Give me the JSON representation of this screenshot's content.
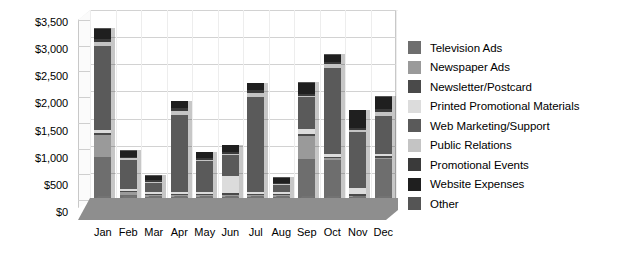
{
  "chart_data": {
    "type": "bar",
    "stacked": true,
    "title": "",
    "xlabel": "",
    "ylabel": "",
    "ylim": [
      0,
      3500
    ],
    "ytick_step": 500,
    "ytick_labels": [
      "$0",
      "$500",
      "$1,000",
      "$1,500",
      "$2,000",
      "$2,500",
      "$3,000",
      "$3,500"
    ],
    "ytick_values": [
      0,
      500,
      1000,
      1500,
      2000,
      2500,
      3000,
      3500
    ],
    "grid": true,
    "legend_position": "right",
    "categories": [
      "Jan",
      "Feb",
      "Mar",
      "Apr",
      "May",
      "Jun",
      "Jul",
      "Aug",
      "Sep",
      "Oct",
      "Nov",
      "Dec"
    ],
    "series": [
      {
        "name": "Television Ads",
        "color": "#6e6e6e",
        "values": [
          800,
          100,
          60,
          60,
          60,
          60,
          60,
          60,
          760,
          740,
          50,
          750
        ]
      },
      {
        "name": "Newspaper Ads",
        "color": "#9a9a9a",
        "values": [
          400,
          40,
          30,
          30,
          30,
          30,
          30,
          30,
          420,
          30,
          30,
          30
        ]
      },
      {
        "name": "Newsletter/Postcard",
        "color": "#4a4a4a",
        "values": [
          40,
          30,
          20,
          20,
          20,
          30,
          20,
          20,
          40,
          30,
          30,
          30
        ]
      },
      {
        "name": "Printed Promotional Materials",
        "color": "#dcdcdc",
        "values": [
          40,
          40,
          40,
          40,
          40,
          330,
          40,
          30,
          80,
          40,
          110,
          40
        ]
      },
      {
        "name": "Web Marketing/Support",
        "color": "#5a5a5a",
        "values": [
          1560,
          530,
          170,
          1420,
          560,
          380,
          1750,
          140,
          590,
          1590,
          1040,
          700
        ]
      },
      {
        "name": "Public Relations",
        "color": "#c4c4c4",
        "values": [
          70,
          30,
          20,
          70,
          20,
          20,
          70,
          20,
          30,
          70,
          30,
          70
        ]
      },
      {
        "name": "Promotional Events",
        "color": "#3a3a3a",
        "values": [
          60,
          20,
          20,
          60,
          50,
          40,
          50,
          20,
          30,
          50,
          30,
          50
        ]
      },
      {
        "name": "Website Expenses",
        "color": "#1f1f1f",
        "values": [
          180,
          120,
          90,
          120,
          100,
          120,
          130,
          90,
          210,
          130,
          330,
          230
        ]
      },
      {
        "name": "Other",
        "color": "#555555",
        "values": [
          10,
          10,
          10,
          10,
          10,
          10,
          10,
          10,
          10,
          10,
          10,
          10
        ]
      }
    ],
    "totals": [
      3160,
      920,
      460,
      1830,
      890,
      1020,
      2160,
      420,
      2170,
      2690,
      1660,
      1910
    ]
  },
  "legend": {
    "items": [
      {
        "label": "Television Ads",
        "color": "#6e6e6e"
      },
      {
        "label": "Newspaper Ads",
        "color": "#9a9a9a"
      },
      {
        "label": "Newsletter/Postcard",
        "color": "#4a4a4a"
      },
      {
        "label": "Printed Promotional Materials",
        "color": "#dcdcdc"
      },
      {
        "label": "Web Marketing/Support",
        "color": "#5a5a5a"
      },
      {
        "label": "Public Relations",
        "color": "#c4c4c4"
      },
      {
        "label": "Promotional Events",
        "color": "#3a3a3a"
      },
      {
        "label": "Website Expenses",
        "color": "#1f1f1f"
      },
      {
        "label": "Other",
        "color": "#555555"
      }
    ]
  }
}
